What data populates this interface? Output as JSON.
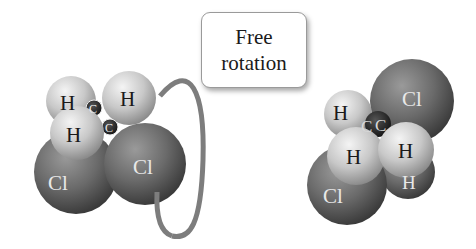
{
  "label": {
    "line1": "Free",
    "line2": "rotation"
  },
  "left_molecule": {
    "atoms": {
      "h_top_left": "H",
      "h_top_right": "H",
      "h_middle": "H",
      "c1": "C",
      "c2": "C",
      "cl_left": "Cl",
      "cl_right": "Cl"
    }
  },
  "right_molecule": {
    "atoms": {
      "cl_top": "Cl",
      "h_top_left": "H",
      "c1": "C",
      "c2": "C",
      "h_middle_left": "H",
      "h_middle_right": "H",
      "h_bottom": "H",
      "cl_bottom": "Cl"
    }
  },
  "colors": {
    "chlorine": "#6e6e6e",
    "hydrogen": "#d0d0d0",
    "carbon": "#2a2a2a",
    "ring": "#808080"
  }
}
